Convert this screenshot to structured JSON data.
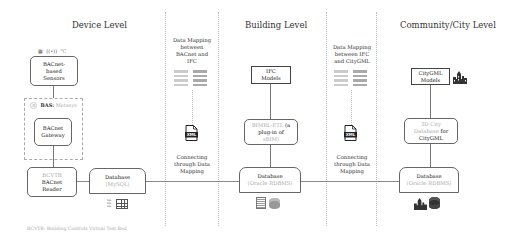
{
  "titles": {
    "device": "Device Level",
    "building": "Building Level",
    "city": "Community/City Level"
  },
  "device": {
    "sensors": [
      "BACnet-",
      "based",
      "Sensors"
    ],
    "sensor_icons": [
      "building-icon",
      "wireless-icon",
      "thermometer-icon"
    ],
    "bas_label": "BAS:",
    "bas_vendor": "Metasys",
    "gateway": [
      "BACnet",
      "Gateway"
    ],
    "reader_prefix": "BCVTB",
    "reader": [
      "BACnet",
      "Reader"
    ],
    "database": "Database",
    "database_engine": "(MySQL)",
    "footnote": "BCVTB: Building Controls Virtual Test Bed"
  },
  "mapping1": {
    "heading": [
      "Data Mapping",
      "between",
      "BACnet and",
      "IFC"
    ],
    "xml_label": "XML",
    "connect": [
      "Connecting",
      "through Data",
      "Mapping"
    ]
  },
  "building": {
    "ifc": [
      "IFC",
      "Models"
    ],
    "plugin_prefix": "BIMRL-ETL",
    "plugin": [
      "(a",
      "plug-in of"
    ],
    "plugin_suffix": "sBIM)",
    "database": "Database",
    "database_engine": "(Oracle RDBMS)"
  },
  "mapping2": {
    "heading": [
      "Data Mapping",
      "between IFC",
      "and CityGML"
    ],
    "xml_label": "XML",
    "connect": [
      "Connecting",
      "through Data",
      "Mapping"
    ]
  },
  "city": {
    "citygml": [
      "CityGML",
      "Models"
    ],
    "db3d_prefix": [
      "3D City",
      "Database"
    ],
    "db3d_suffix": "for",
    "db3d_last": "CityGML",
    "database": "Database",
    "database_engine": "(Oracle RDBMS)"
  },
  "colors": {
    "line": "#777777",
    "muted_text": "#aaaaaa",
    "divider": "#bbbbbb"
  }
}
